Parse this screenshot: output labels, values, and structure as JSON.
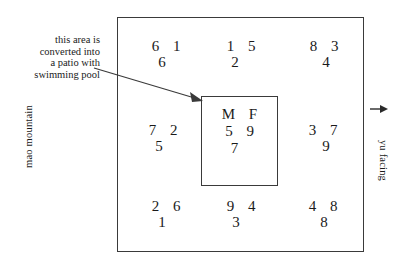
{
  "diagram": {
    "annotation": {
      "lines": [
        "this area is",
        "converted into",
        "a patio with",
        "swimming pool"
      ],
      "arrow_icon": "arrow-pointing-right-down"
    },
    "labels": {
      "left": "mao mountain",
      "right": "yu facing",
      "right_arrow_icon": "arrow-right-icon"
    },
    "center": {
      "letters": "M  F",
      "middle_row": "5  9",
      "bottom_row": "7"
    },
    "cells": {
      "nw": {
        "top": "6  1",
        "bottom": "6"
      },
      "n": {
        "top": "1  5",
        "bottom": "2"
      },
      "ne": {
        "top": "8  3",
        "bottom": "4"
      },
      "w": {
        "top": "7  2",
        "bottom": "5"
      },
      "e": {
        "top": "3  7",
        "bottom": "9"
      },
      "sw": {
        "top": "2  6",
        "bottom": "1"
      },
      "s": {
        "top": "9  4",
        "bottom": "3"
      },
      "se": {
        "top": "4  8",
        "bottom": "8"
      }
    },
    "colors": {
      "line": "#3a3a3a",
      "text": "#1a1a1a",
      "background": "#ffffff"
    }
  }
}
